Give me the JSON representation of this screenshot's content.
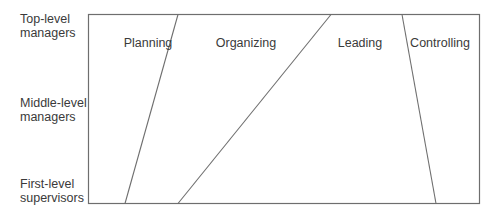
{
  "levels": [
    {
      "line1": "Top-level",
      "line2": "managers"
    },
    {
      "line1": "Middle-level",
      "line2": "managers"
    },
    {
      "line1": "First-level",
      "line2": "supervisors"
    }
  ],
  "functions": [
    {
      "label": "Planning"
    },
    {
      "label": "Organizing"
    },
    {
      "label": "Leading"
    },
    {
      "label": "Controlling"
    }
  ],
  "colors": {
    "line": "#6e6e6e",
    "text": "#3a3a3a",
    "background": "#ffffff"
  }
}
